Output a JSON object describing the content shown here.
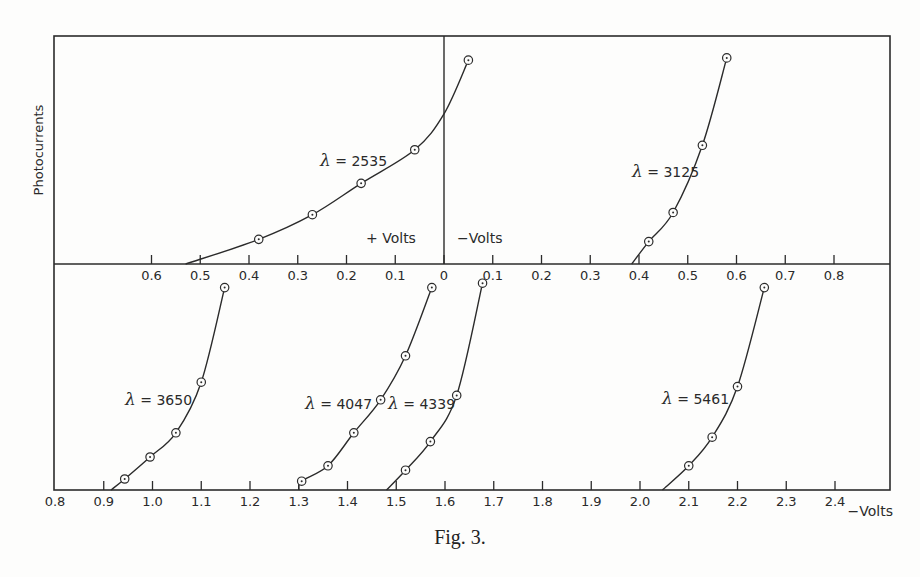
{
  "caption": "Fig. 3.",
  "chart_data": {
    "type": "line",
    "title": "Fig. 3.",
    "ylabel": "Photocurrents",
    "panels": [
      {
        "name": "upper",
        "xaxis_labels": {
          "left": "+ Volts",
          "right": "- Volts"
        },
        "xticks": [
          {
            "value": 0.6,
            "label": "0.6"
          },
          {
            "value": 0.5,
            "label": "0.5"
          },
          {
            "value": 0.4,
            "label": "0.4"
          },
          {
            "value": 0.3,
            "label": "0.3"
          },
          {
            "value": 0.2,
            "label": "0.2"
          },
          {
            "value": 0.1,
            "label": "0.1"
          },
          {
            "value": 0.0,
            "label": "0"
          },
          {
            "value": -0.1,
            "label": "0.1"
          },
          {
            "value": -0.2,
            "label": "0.2"
          },
          {
            "value": -0.3,
            "label": "0.3"
          },
          {
            "value": -0.4,
            "label": "0.4"
          },
          {
            "value": -0.5,
            "label": "0.5"
          },
          {
            "value": -0.6,
            "label": "0.6"
          },
          {
            "value": -0.7,
            "label": "0.7"
          },
          {
            "value": -0.8,
            "label": "0.8"
          }
        ],
        "note": "x values: positive = + volts (left of 0), negative = - volts (right of 0); y is relative photocurrent (0 = axis, 1 = top of panel)",
        "series": [
          {
            "name": "λ = 2535",
            "label": "2535",
            "points": [
              [
                0.38,
                0.11
              ],
              [
                0.27,
                0.22
              ],
              [
                0.17,
                0.36
              ],
              [
                0.06,
                0.51
              ],
              [
                -0.05,
                0.91
              ]
            ],
            "curve": [
              [
                0.53,
                0.0
              ],
              [
                0.38,
                0.11
              ],
              [
                0.27,
                0.22
              ],
              [
                0.17,
                0.36
              ],
              [
                0.06,
                0.51
              ],
              [
                0.0,
                0.67
              ],
              [
                -0.05,
                0.91
              ]
            ]
          },
          {
            "name": "λ = 3125",
            "label": "3125",
            "points": [
              [
                -0.42,
                0.1
              ],
              [
                -0.47,
                0.23
              ],
              [
                -0.53,
                0.53
              ],
              [
                -0.58,
                0.92
              ]
            ],
            "curve": [
              [
                -0.385,
                0.0
              ],
              [
                -0.42,
                0.1
              ],
              [
                -0.47,
                0.23
              ],
              [
                -0.53,
                0.53
              ],
              [
                -0.58,
                0.92
              ]
            ]
          }
        ]
      },
      {
        "name": "lower",
        "xaxis_labels": {
          "right": "-Volts"
        },
        "xticks": [
          {
            "value": 0.8,
            "label": "0.8"
          },
          {
            "value": 0.9,
            "label": "0.9"
          },
          {
            "value": 1.0,
            "label": "1.0"
          },
          {
            "value": 1.1,
            "label": "1.1"
          },
          {
            "value": 1.2,
            "label": "1.2"
          },
          {
            "value": 1.3,
            "label": "1.3"
          },
          {
            "value": 1.4,
            "label": "1.4"
          },
          {
            "value": 1.5,
            "label": "1.5"
          },
          {
            "value": 1.6,
            "label": "1.6"
          },
          {
            "value": 1.7,
            "label": "1.7"
          },
          {
            "value": 1.8,
            "label": "1.8"
          },
          {
            "value": 1.9,
            "label": "1.9"
          },
          {
            "value": 2.0,
            "label": "2.0"
          },
          {
            "value": 2.1,
            "label": "2.1"
          },
          {
            "value": 2.2,
            "label": "2.2"
          },
          {
            "value": 2.3,
            "label": "2.3"
          },
          {
            "value": 2.4,
            "label": "2.4"
          }
        ],
        "series": [
          {
            "name": "λ = 3650",
            "label": "3650",
            "points": [
              [
                0.943,
                0.05
              ],
              [
                0.995,
                0.15
              ],
              [
                1.048,
                0.26
              ],
              [
                1.1,
                0.49
              ],
              [
                1.148,
                0.92
              ]
            ],
            "curve": [
              [
                0.915,
                0.0
              ],
              [
                0.943,
                0.05
              ],
              [
                0.995,
                0.15
              ],
              [
                1.048,
                0.26
              ],
              [
                1.1,
                0.49
              ],
              [
                1.148,
                0.92
              ]
            ]
          },
          {
            "name": "λ = 4047",
            "label": "4047",
            "points": [
              [
                1.306,
                0.04
              ],
              [
                1.36,
                0.11
              ],
              [
                1.413,
                0.26
              ],
              [
                1.468,
                0.41
              ],
              [
                1.519,
                0.61
              ],
              [
                1.573,
                0.92
              ]
            ],
            "curve": [
              [
                1.3,
                0.0
              ],
              [
                1.306,
                0.04
              ],
              [
                1.36,
                0.11
              ],
              [
                1.413,
                0.26
              ],
              [
                1.468,
                0.41
              ],
              [
                1.519,
                0.61
              ],
              [
                1.573,
                0.92
              ]
            ]
          },
          {
            "name": "λ = 4339",
            "label": "4339",
            "points": [
              [
                1.519,
                0.09
              ],
              [
                1.57,
                0.22
              ],
              [
                1.624,
                0.43
              ],
              [
                1.677,
                0.94
              ]
            ],
            "curve": [
              [
                1.48,
                0.0
              ],
              [
                1.519,
                0.09
              ],
              [
                1.57,
                0.22
              ],
              [
                1.624,
                0.43
              ],
              [
                1.677,
                0.94
              ]
            ]
          },
          {
            "name": "λ = 5461",
            "label": "5461",
            "points": [
              [
                2.1,
                0.11
              ],
              [
                2.148,
                0.24
              ],
              [
                2.2,
                0.47
              ],
              [
                2.255,
                0.92
              ]
            ],
            "curve": [
              [
                2.046,
                0.0
              ],
              [
                2.1,
                0.11
              ],
              [
                2.148,
                0.24
              ],
              [
                2.2,
                0.47
              ],
              [
                2.255,
                0.92
              ]
            ]
          }
        ]
      }
    ]
  },
  "layout_hints": {
    "label_positions": {
      "2535": [
        320,
        166
      ],
      "3125": [
        632,
        177
      ],
      "3650": [
        125,
        405
      ],
      "4047": [
        305,
        409
      ],
      "4339": [
        388,
        409
      ],
      "5461": [
        662,
        404
      ]
    }
  }
}
